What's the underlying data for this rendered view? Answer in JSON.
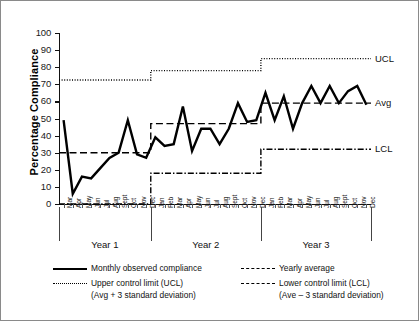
{
  "chart_data": {
    "type": "line",
    "title": "",
    "xlabel": "",
    "ylabel": "Percentage Compliance",
    "ylim": [
      0,
      100
    ],
    "ytick_labels": [
      "100",
      "90",
      "80",
      "70",
      "60",
      "50",
      "40",
      "30",
      "20",
      "10",
      "0"
    ],
    "ytick_values": [
      100,
      90,
      80,
      70,
      60,
      50,
      40,
      30,
      20,
      10,
      0
    ],
    "grid": false,
    "legend_position": "below-axes",
    "year_groups": [
      {
        "label": "Year 1",
        "months": [
          "Mar",
          "Apr",
          "May",
          "Jun",
          "Jul",
          "Aug",
          "Sept",
          "Oct",
          "Nov",
          "Dec"
        ]
      },
      {
        "label": "Year 2",
        "months": [
          "Jan",
          "Feb",
          "Mar",
          "Apr",
          "May",
          "Jun",
          "Jul",
          "Aug",
          "Sept",
          "Oct",
          "Nov",
          "Dec"
        ]
      },
      {
        "label": "Year 3",
        "months": [
          "Jan",
          "Feb",
          "Mar",
          "Apr",
          "May",
          "Jun",
          "Jul",
          "Aug",
          "Sept",
          "Oct",
          "Nov",
          "Dec"
        ]
      }
    ],
    "categories": [
      "Y1-Mar",
      "Y1-Apr",
      "Y1-May",
      "Y1-Jun",
      "Y1-Jul",
      "Y1-Aug",
      "Y1-Sept",
      "Y1-Oct",
      "Y1-Nov",
      "Y1-Dec",
      "Y2-Jan",
      "Y2-Feb",
      "Y2-Mar",
      "Y2-Apr",
      "Y2-May",
      "Y2-Jun",
      "Y2-Jul",
      "Y2-Aug",
      "Y2-Sept",
      "Y2-Oct",
      "Y2-Nov",
      "Y2-Dec",
      "Y3-Jan",
      "Y3-Feb",
      "Y3-Mar",
      "Y3-Apr",
      "Y3-May",
      "Y3-Jun",
      "Y3-Jul",
      "Y3-Aug",
      "Y3-Sept",
      "Y3-Oct",
      "Y3-Nov",
      "Y3-Dec"
    ],
    "series": [
      {
        "name": "Monthly observed compliance",
        "style": "solid",
        "values": [
          49,
          6,
          16,
          15,
          21,
          27,
          30,
          49,
          29,
          27,
          39,
          34,
          35,
          57,
          31,
          44,
          44,
          35,
          44,
          59,
          48,
          49,
          65,
          49,
          63,
          44,
          59,
          69,
          59,
          69,
          59,
          66,
          69,
          58
        ]
      },
      {
        "name": "Yearly average",
        "style": "dashed",
        "step_values": [
          {
            "group": "Year 1",
            "value": 30
          },
          {
            "group": "Year 2",
            "value": 47
          },
          {
            "group": "Year 3",
            "value": 59
          }
        ]
      },
      {
        "name": "Upper control limit (UCL)",
        "style": "dotted",
        "sublabel": "(Avg + 3 standard deviation)",
        "step_values": [
          {
            "group": "Year 1",
            "value": 72.5
          },
          {
            "group": "Year 2",
            "value": 78
          },
          {
            "group": "Year 3",
            "value": 85
          }
        ]
      },
      {
        "name": "Lower control limit (LCL)",
        "style": "dash-dot",
        "sublabel": "(Ave – 3 standard deviation)",
        "step_values": [
          {
            "group": "Year 1",
            "value": 0
          },
          {
            "group": "Year 2",
            "value": 18
          },
          {
            "group": "Year 3",
            "value": 32
          }
        ]
      }
    ],
    "right_annotations": [
      {
        "label": "UCL",
        "value": 85
      },
      {
        "label": "Avg",
        "value": 59
      },
      {
        "label": "LCL",
        "value": 32
      }
    ],
    "colors": {
      "line": "#000000",
      "axis": "#111111",
      "frame": "#8a8a8a"
    }
  },
  "legend": {
    "items": [
      {
        "label": "Monthly observed compliance",
        "sublabel": "",
        "style": "solid"
      },
      {
        "label": "Yearly average",
        "sublabel": "",
        "style": "dashed"
      },
      {
        "label": "Upper control limit (UCL)",
        "sublabel": "(Avg + 3 standard deviation)",
        "style": "dotted"
      },
      {
        "label": "Lower control limit (LCL)",
        "sublabel": "(Ave – 3 standard deviation)",
        "style": "dash-dot"
      }
    ]
  }
}
